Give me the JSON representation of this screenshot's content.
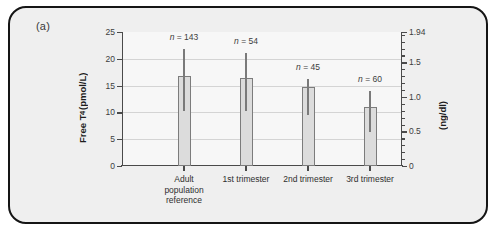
{
  "figure": {
    "panel_label": "(a)"
  },
  "chart_data": {
    "type": "bar",
    "title": "",
    "xlabel": "",
    "ylabel": "Free T4 (pmol/L)",
    "ylabel_secondary": "(ng/dl)",
    "ylim": [
      0,
      25
    ],
    "ylim_secondary": [
      0,
      1.94
    ],
    "grid": true,
    "legend_position": "none",
    "categories": [
      "Adult\npopulation\nreference",
      "1st trimester",
      "2nd trimester",
      "3rd trimester"
    ],
    "values": [
      16.8,
      16.4,
      14.8,
      11.0
    ],
    "error_low": [
      10.2,
      10.3,
      9.6,
      6.3
    ],
    "error_high": [
      21.8,
      21.0,
      16.3,
      14.0
    ],
    "point_labels": [
      "n = 143",
      "n = 54",
      "n = 45",
      "n = 60"
    ],
    "n_values": [
      143,
      54,
      45,
      60
    ],
    "yticks": [
      0,
      5,
      10,
      15,
      20,
      25
    ],
    "ytick_labels": [
      "0",
      "5",
      "10",
      "15",
      "20",
      "25"
    ],
    "yticks_secondary": [
      0,
      0.5,
      1.0,
      1.5,
      1.94
    ],
    "ytick_labels_secondary": [
      "0",
      "0.5",
      "1.0",
      "1.5",
      "1.94"
    ],
    "colors": {
      "bar_fill": "#dcdcdc",
      "bar_stroke": "#7c7c7c",
      "error_bar": "#7a7a7a",
      "gridline": "#d4d4d4",
      "axis": "#4a4a4a",
      "panel_border": "#151515",
      "panel_background": "#efefef",
      "plot_background": "#f7f7f7"
    }
  }
}
